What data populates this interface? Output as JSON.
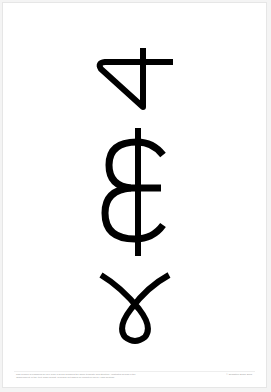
{
  "poster": {
    "background": "#ffffff",
    "ink_color": "#000000",
    "glyphs": [
      {
        "name": "rotated-four-glyph"
      },
      {
        "name": "cedi-like-glyph"
      },
      {
        "name": "loop-gamma-glyph"
      }
    ],
    "footer": {
      "caption": "This symbol is published for free from a series following the same template and structure. Illustrated glyphs in the 'Discernment' in the 'text' small format. Typeface set based on Monotype Neue Haas Grotesk.",
      "credit": "© Sébastien Blanc 2015"
    }
  }
}
